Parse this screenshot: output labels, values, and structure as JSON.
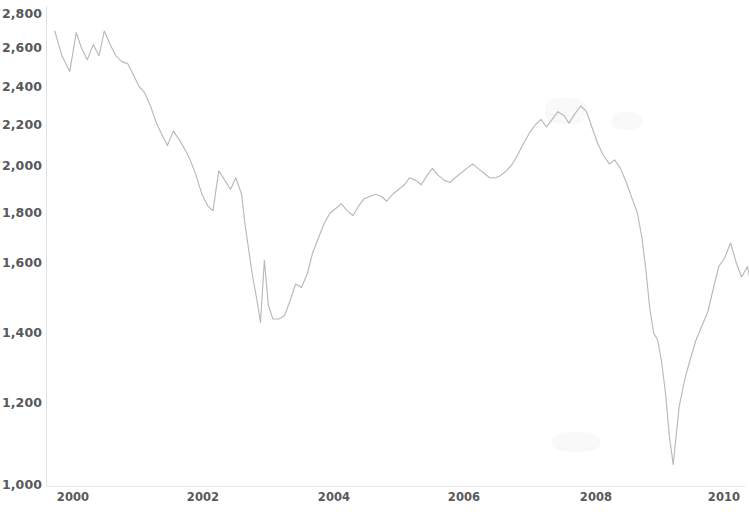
{
  "chart_data": {
    "type": "line",
    "title": "",
    "subtitle": "",
    "xlabel": "",
    "ylabel": "",
    "legend": [],
    "grid": false,
    "yscale": "log-like",
    "xlim": [
      1999.6,
      2010.6
    ],
    "ylim": [
      1000,
      2900
    ],
    "y_ticks": [
      {
        "label": "2,800",
        "value": 2800,
        "y_px": 14
      },
      {
        "label": "2,600",
        "value": 2600,
        "y_px": 48
      },
      {
        "label": "2,400",
        "value": 2400,
        "y_px": 87
      },
      {
        "label": "2,200",
        "value": 2200,
        "y_px": 125
      },
      {
        "label": "2,000",
        "value": 2000,
        "y_px": 166
      },
      {
        "label": "1,800",
        "value": 1800,
        "y_px": 213
      },
      {
        "label": "1,600",
        "value": 1600,
        "y_px": 263
      },
      {
        "label": "1,400",
        "value": 1400,
        "y_px": 333
      },
      {
        "label": "1,200",
        "value": 1200,
        "y_px": 403
      },
      {
        "label": "1,000",
        "value": 1000,
        "y_px": 485
      }
    ],
    "x_ticks": [
      {
        "label": "2000",
        "value": 2000,
        "x_px": 73
      },
      {
        "label": "2002",
        "value": 2002,
        "x_px": 203
      },
      {
        "label": "2004",
        "value": 2004,
        "x_px": 334
      },
      {
        "label": "2006",
        "value": 2006,
        "x_px": 464
      },
      {
        "label": "2008",
        "value": 2008,
        "x_px": 596
      },
      {
        "label": "2010",
        "value": 2010,
        "x_px": 724
      }
    ],
    "line_color": "#b9b9bc",
    "series": [
      {
        "name": "index",
        "x": [
          1999.72,
          1999.83,
          1999.95,
          2000.05,
          2000.13,
          2000.22,
          2000.31,
          2000.4,
          2000.48,
          2000.57,
          2000.66,
          2000.75,
          2000.84,
          2000.93,
          2001.02,
          2001.1,
          2001.19,
          2001.28,
          2001.37,
          2001.45,
          2001.54,
          2001.63,
          2001.72,
          2001.8,
          2001.89,
          2001.98,
          2002.07,
          2002.15,
          2002.24,
          2002.33,
          2002.42,
          2002.5,
          2002.59,
          2002.64,
          2002.7,
          2002.76,
          2002.82,
          2002.88,
          2002.94,
          2003.0,
          2003.07,
          2003.16,
          2003.25,
          2003.33,
          2003.42,
          2003.51,
          2003.6,
          2003.68,
          2003.77,
          2003.86,
          2003.95,
          2004.04,
          2004.12,
          2004.21,
          2004.3,
          2004.39,
          2004.47,
          2004.56,
          2004.65,
          2004.74,
          2004.82,
          2004.91,
          2005.0,
          2005.09,
          2005.17,
          2005.26,
          2005.35,
          2005.44,
          2005.52,
          2005.61,
          2005.7,
          2005.79,
          2005.87,
          2005.96,
          2006.05,
          2006.14,
          2006.22,
          2006.31,
          2006.4,
          2006.49,
          2006.57,
          2006.66,
          2006.75,
          2006.84,
          2006.92,
          2007.01,
          2007.1,
          2007.19,
          2007.27,
          2007.36,
          2007.45,
          2007.54,
          2007.62,
          2007.71,
          2007.8,
          2007.89,
          2007.97,
          2008.06,
          2008.15,
          2008.24,
          2008.32,
          2008.41,
          2008.5,
          2008.59,
          2008.67,
          2008.74,
          2008.8,
          2008.86,
          2008.92,
          2008.98,
          2009.04,
          2009.1,
          2009.16,
          2009.22,
          2009.31,
          2009.4,
          2009.49,
          2009.57,
          2009.66,
          2009.75,
          2009.84,
          2009.92,
          2010.01,
          2010.1,
          2010.19,
          2010.27,
          2010.36,
          2010.45
        ],
        "y": [
          2700,
          2560,
          2480,
          2690,
          2600,
          2540,
          2620,
          2560,
          2700,
          2620,
          2560,
          2530,
          2520,
          2460,
          2400,
          2370,
          2300,
          2210,
          2150,
          2100,
          2170,
          2130,
          2080,
          2030,
          1960,
          1880,
          1830,
          1810,
          1980,
          1940,
          1900,
          1950,
          1880,
          1760,
          1650,
          1560,
          1500,
          1430,
          1610,
          1480,
          1440,
          1440,
          1450,
          1490,
          1540,
          1530,
          1570,
          1640,
          1700,
          1760,
          1800,
          1820,
          1840,
          1810,
          1790,
          1830,
          1860,
          1870,
          1880,
          1870,
          1850,
          1880,
          1900,
          1920,
          1950,
          1940,
          1920,
          1960,
          1990,
          1960,
          1940,
          1930,
          1950,
          1970,
          1990,
          2010,
          1990,
          1970,
          1950,
          1950,
          1960,
          1980,
          2010,
          2060,
          2110,
          2160,
          2200,
          2230,
          2190,
          2230,
          2270,
          2250,
          2210,
          2260,
          2300,
          2270,
          2190,
          2110,
          2050,
          2010,
          2030,
          1990,
          1930,
          1860,
          1800,
          1700,
          1580,
          1470,
          1400,
          1380,
          1320,
          1230,
          1120,
          1050,
          1190,
          1270,
          1330,
          1380,
          1420,
          1460,
          1530,
          1590,
          1620,
          1680,
          1600,
          1560,
          1590,
          1510
        ]
      }
    ],
    "annotations": [],
    "notable_points": {
      "start_2000_high": 2700,
      "dotcom_peak": 2700,
      "first_trough_2002": 1430,
      "second_trough_2003": 1440,
      "precrisis_peak_2007": 2300,
      "crisis_bottom_2009": 1050,
      "end_value_2010": 1510
    }
  }
}
